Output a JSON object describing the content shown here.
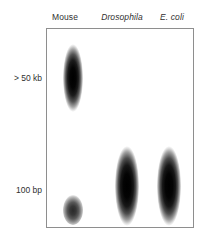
{
  "figure": {
    "type": "gel-electrophoresis-diagram",
    "background_color": "#ffffff",
    "gel_border_color": "#8e8e8e",
    "text_color": "#2f2f2f"
  },
  "lanes": [
    {
      "id": "mouse",
      "label": "Mouse",
      "italic": false
    },
    {
      "id": "drosophila",
      "label": "Drosophila",
      "italic": true
    },
    {
      "id": "ecoli",
      "label": "E. coli",
      "italic": true
    }
  ],
  "size_markers": [
    {
      "id": "high",
      "label": "> 50 kb"
    },
    {
      "id": "low",
      "label": "100 bp"
    }
  ],
  "bands": [
    {
      "lane": "mouse",
      "marker": "> 50 kb",
      "intensity": "dark",
      "size": "large"
    },
    {
      "lane": "mouse",
      "marker": "100 bp",
      "intensity": "medium",
      "size": "small"
    },
    {
      "lane": "drosophila",
      "marker": "100 bp",
      "intensity": "dark",
      "size": "large"
    },
    {
      "lane": "ecoli",
      "marker": "100 bp",
      "intensity": "dark",
      "size": "large"
    }
  ]
}
